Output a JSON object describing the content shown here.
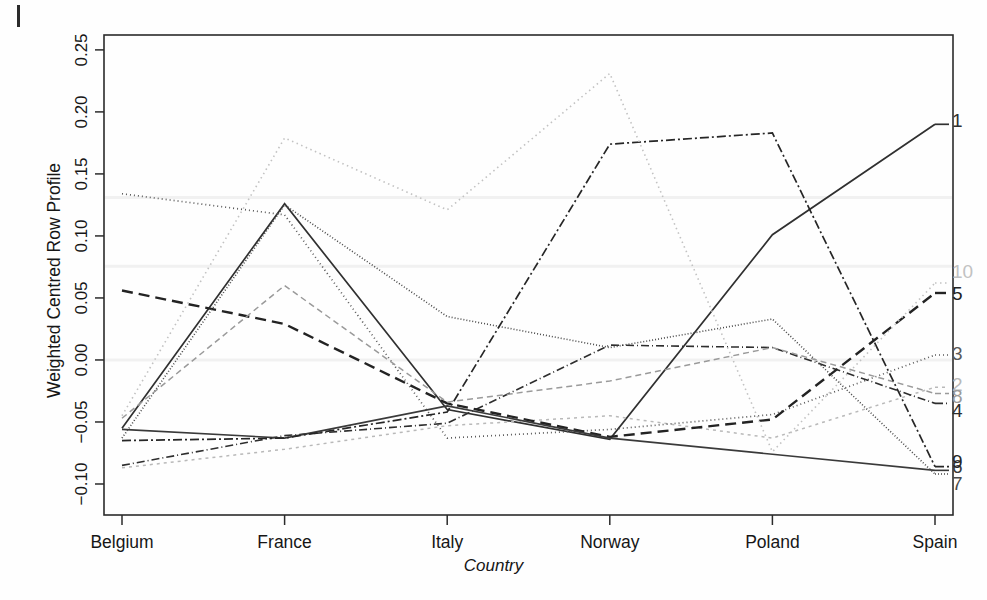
{
  "chart_data": {
    "type": "line",
    "title": "",
    "xlabel": "Country",
    "ylabel": "Weighted Centred Row Profile",
    "categories": [
      "Belgium",
      "France",
      "Italy",
      "Norway",
      "Poland",
      "Spain"
    ],
    "x_tick_labels": [
      "Belgium",
      "France",
      "Italy",
      "Norway",
      "Poland",
      "Spain"
    ],
    "y_tick_labels": [
      "-0.10",
      "-0.05",
      "0.00",
      "0.05",
      "0.10",
      "0.15",
      "0.20",
      "0.25"
    ],
    "y_ticks": [
      -0.1,
      -0.05,
      0.0,
      0.05,
      0.1,
      0.15,
      0.2,
      0.25
    ],
    "ylim": [
      -0.125,
      0.262
    ],
    "grid": false,
    "legend": "right-edge-series-labels",
    "series": [
      {
        "name": "1",
        "label": "1",
        "values": [
          -0.055,
          0.126,
          -0.04,
          -0.064,
          0.101,
          0.19
        ],
        "dash": "none",
        "color": "#303030",
        "width": 1.7
      },
      {
        "name": "2",
        "label": "2",
        "values": [
          -0.087,
          -0.072,
          -0.053,
          -0.045,
          -0.063,
          -0.022
        ],
        "dash": "3,4",
        "color": "#b9b9b9",
        "width": 1.5
      },
      {
        "name": "3",
        "label": "3",
        "values": [
          0.134,
          0.117,
          -0.063,
          -0.056,
          -0.044,
          0.004
        ],
        "dash": "1,3",
        "color": "#5a5a5a",
        "width": 1.7
      },
      {
        "name": "4",
        "label": "4",
        "values": [
          -0.085,
          -0.061,
          -0.051,
          0.012,
          0.01,
          -0.035
        ],
        "dash": "8,3,1,3",
        "color": "#2e2e2e",
        "width": 1.6
      },
      {
        "name": "5",
        "label": "5",
        "values": [
          0.056,
          0.029,
          -0.035,
          -0.062,
          -0.048,
          0.054
        ],
        "dash": "11,6",
        "color": "#232323",
        "width": 2.4
      },
      {
        "name": "6",
        "label": "6",
        "values": [
          -0.056,
          -0.063,
          -0.037,
          -0.063,
          -0.076,
          -0.089
        ],
        "dash": "none",
        "color": "#3a3a3a",
        "width": 1.6
      },
      {
        "name": "7",
        "label": "7",
        "values": [
          -0.063,
          0.125,
          0.035,
          0.01,
          0.033,
          -0.092
        ],
        "dash": "1,2",
        "color": "#4a4a4a",
        "width": 1.6
      },
      {
        "name": "8",
        "label": "8",
        "values": [
          -0.047,
          0.06,
          -0.034,
          -0.017,
          0.01,
          -0.027
        ],
        "dash": "6,4",
        "color": "#9a9a9a",
        "width": 1.5
      },
      {
        "name": "9",
        "label": "9",
        "values": [
          -0.065,
          -0.063,
          -0.042,
          0.174,
          0.183,
          -0.086
        ],
        "dash": "9,3,2,3",
        "color": "#262626",
        "width": 1.7
      },
      {
        "name": "10",
        "label": "10",
        "values": [
          -0.045,
          0.179,
          0.121,
          0.231,
          -0.074,
          0.062
        ],
        "dash": "1.5,3.5",
        "color": "#c2c2c2",
        "width": 1.6
      }
    ],
    "series_end_labels": [
      {
        "text": "1",
        "value": 0.19,
        "dy": -2
      },
      {
        "text": "10",
        "value": 0.062,
        "dy": -10
      },
      {
        "text": "5",
        "value": 0.054,
        "dy": 2
      },
      {
        "text": "3",
        "value": 0.004,
        "dy": 0
      },
      {
        "text": "2",
        "value": -0.027,
        "dy": -7
      },
      {
        "text": "8",
        "value": -0.027,
        "dy": 5
      },
      {
        "text": "4",
        "value": -0.035,
        "dy": 9
      },
      {
        "text": "6",
        "value": -0.089,
        "dy": -2
      },
      {
        "text": "9",
        "value": -0.086,
        "dy": -4
      },
      {
        "text": "7",
        "value": -0.092,
        "dy": 11
      }
    ]
  },
  "axis": {
    "ylabel_text": "Weighted Centred Row Profile",
    "xlabel_text": "Country"
  },
  "colors": {
    "axis": "#2b2b2b",
    "background": "#fefefe",
    "text": "#161616"
  }
}
